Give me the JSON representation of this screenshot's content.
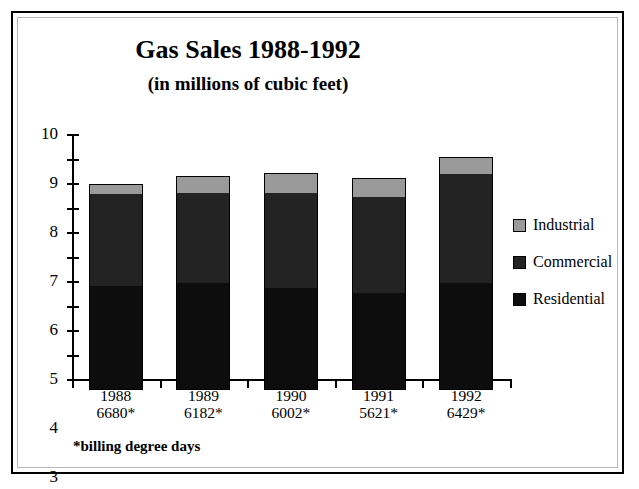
{
  "chart_data": {
    "type": "bar",
    "subtype": "stacked-column",
    "title": "Gas Sales 1988-1992",
    "subtitle": "(in millions of cubic feet)",
    "xlabel": "",
    "ylabel": "",
    "ylim": [
      0,
      10
    ],
    "ytick_step": 1,
    "yticks": [
      "0",
      "1",
      "2",
      "3",
      "4",
      "5",
      "6",
      "7",
      "8",
      "9",
      "10"
    ],
    "grid": false,
    "legend_position": "right",
    "categories": [
      "1988",
      "1989",
      "1990",
      "1991",
      "1992"
    ],
    "category_sublabels": [
      "6680*",
      "6182*",
      "6002*",
      "5621*",
      "6429*"
    ],
    "series": [
      {
        "name": "Residential",
        "color": "#0d0d0d",
        "values": [
          4.3,
          4.4,
          4.2,
          4.0,
          4.4
        ]
      },
      {
        "name": "Commercial",
        "color": "#232323",
        "values": [
          3.75,
          3.7,
          3.9,
          3.9,
          4.45
        ]
      },
      {
        "name": "Industrial",
        "color": "#9a9a9a",
        "values": [
          0.35,
          0.65,
          0.75,
          0.75,
          0.65
        ]
      }
    ],
    "totals": [
      8.4,
      8.75,
      8.85,
      8.65,
      9.5
    ],
    "annotations": [
      "*billing degree days"
    ]
  },
  "titles": {
    "main": "Gas Sales 1988-1992",
    "sub": "(in millions of cubic feet)"
  },
  "axis": {
    "y_labels": [
      "10",
      "9",
      "8",
      "7",
      "6",
      "5",
      "4",
      "3",
      "2",
      "1",
      "0"
    ]
  },
  "categories": [
    {
      "year": "1988",
      "degree_days": "6680*"
    },
    {
      "year": "1989",
      "degree_days": "6182*"
    },
    {
      "year": "1990",
      "degree_days": "6002*"
    },
    {
      "year": "1991",
      "degree_days": "5621*"
    },
    {
      "year": "1992",
      "degree_days": "6429*"
    }
  ],
  "legend": {
    "items": [
      {
        "label": "Industrial",
        "color": "#9a9a9a"
      },
      {
        "label": "Commercial",
        "color": "#232323"
      },
      {
        "label": "Residential",
        "color": "#0d0d0d"
      }
    ]
  },
  "footnote": "*billing degree days"
}
